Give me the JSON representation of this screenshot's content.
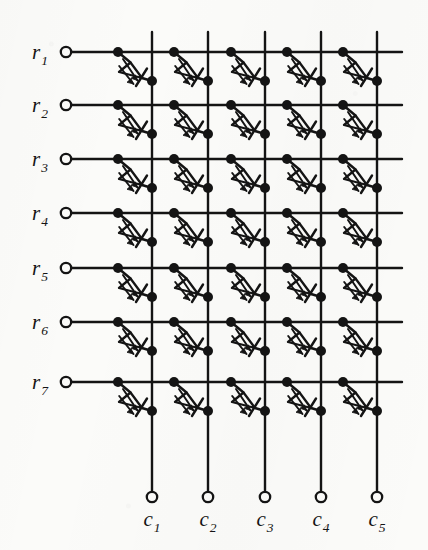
{
  "figure": {
    "kind": "circuit-schematic",
    "background_color": "#fbfbf9",
    "ink_color": "#141414",
    "rows": 7,
    "columns": 5,
    "cell_symbol": "light-emitting-diode",
    "row_labels": [
      {
        "base": "r",
        "sub": "1"
      },
      {
        "base": "r",
        "sub": "2"
      },
      {
        "base": "r",
        "sub": "3"
      },
      {
        "base": "r",
        "sub": "4"
      },
      {
        "base": "r",
        "sub": "5"
      },
      {
        "base": "r",
        "sub": "6"
      },
      {
        "base": "r",
        "sub": "7"
      }
    ],
    "column_labels": [
      {
        "base": "c",
        "sub": "1"
      },
      {
        "base": "c",
        "sub": "2"
      },
      {
        "base": "c",
        "sub": "3"
      },
      {
        "base": "c",
        "sub": "4"
      },
      {
        "base": "c",
        "sub": "5"
      }
    ],
    "geometry": {
      "row_y": [
        52,
        105,
        159,
        213,
        268,
        322,
        382
      ],
      "col_x": [
        152,
        208,
        265,
        321,
        377
      ],
      "row_line_x_start": 72,
      "row_line_x_end": 402,
      "col_line_y_top": 32,
      "col_line_y_bottom": 492,
      "row_terminal_x": 66,
      "col_terminal_y": 497,
      "row_node_dx": -34,
      "col_node_dy": 29,
      "terminal_radius": 5.2,
      "node_radius": 5.0,
      "line_width": 2.4
    }
  }
}
